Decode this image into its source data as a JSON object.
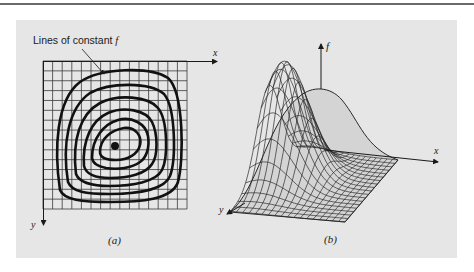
{
  "figure": {
    "panel_a": {
      "annotation": "Lines of constant f",
      "annotation_prefix": "Lines of constant ",
      "annotation_var": "f",
      "x_axis_label": "x",
      "y_axis_label": "y",
      "caption": "(a)",
      "grid": {
        "columns": 15,
        "rows": 15
      },
      "contour_count": 6,
      "center_marker": "maximum-point"
    },
    "panel_b": {
      "z_axis_label": "f",
      "x_axis_label": "x",
      "y_axis_label": "y",
      "caption": "(b)",
      "surface": "3D wireframe mesh of f(x, y) with a single peak"
    }
  },
  "colors": {
    "panel_background": "#e6e6e6",
    "ink": "#1a1a1a",
    "grid_line": "#3a3a3a",
    "rule": "#6a6a6a",
    "surface_fill": "#c9c9c9"
  }
}
